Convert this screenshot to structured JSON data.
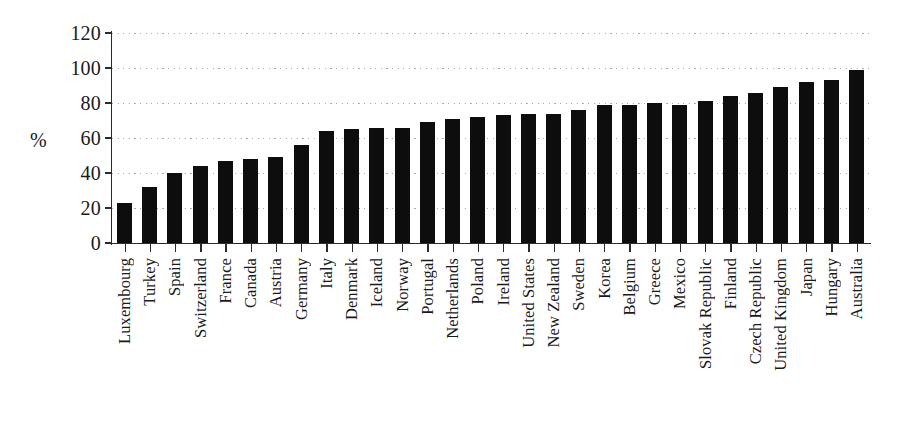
{
  "chart_data": {
    "type": "bar",
    "title": "",
    "xlabel": "",
    "ylabel": "%",
    "ylim": [
      0,
      120
    ],
    "yticks": [
      0,
      20,
      40,
      60,
      80,
      100,
      120
    ],
    "grid": true,
    "legend": null,
    "orientation": "vertical",
    "bar_color": "#0d0d0d",
    "categories": [
      "Luxembourg",
      "Turkey",
      "Spain",
      "Switzerland",
      "France",
      "Canada",
      "Austria",
      "Germany",
      "Italy",
      "Denmark",
      "Iceland",
      "Norway",
      "Portugal",
      "Netherlands",
      "Poland",
      "Ireland",
      "United States",
      "New Zealand",
      "Sweden",
      "Korea",
      "Belgium",
      "Greece",
      "Mexico",
      "Slovak Republic",
      "Finland",
      "Czech Republic",
      "United Kingdom",
      "Japan",
      "Hungary",
      "Australia"
    ],
    "values": [
      23,
      32,
      40,
      44,
      47,
      48,
      49,
      56,
      64,
      65,
      66,
      66,
      69,
      71,
      72,
      73,
      74,
      74,
      76,
      79,
      79,
      80,
      79,
      81,
      84,
      86,
      89,
      92,
      93,
      99
    ]
  }
}
